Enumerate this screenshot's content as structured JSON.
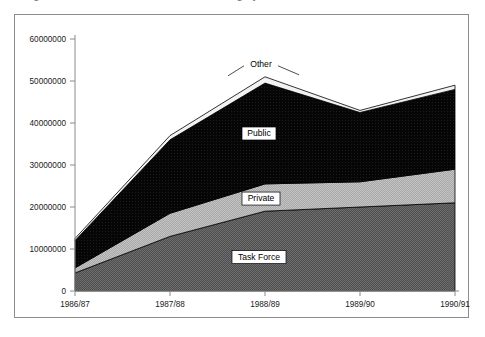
{
  "caption_remnant": "Figure 3.  Residential construction financing by source of funds",
  "chart_data": {
    "type": "area",
    "stacked": true,
    "title": "",
    "xlabel": "",
    "ylabel": "",
    "categories": [
      "1986/87",
      "1987/88",
      "1988/89",
      "1989/90",
      "1990/91"
    ],
    "ylim": [
      0,
      60000000
    ],
    "yticks": [
      0,
      10000000,
      20000000,
      30000000,
      40000000,
      50000000,
      60000000
    ],
    "ytick_labels": [
      "0",
      "10000000",
      "20000000",
      "30000000",
      "40000000",
      "50000000",
      "60000000"
    ],
    "grid": false,
    "legend_position": "inline-annotations",
    "series": [
      {
        "name": "Task Force",
        "fill": "#595959",
        "pattern": "dark-hatch",
        "values": [
          4300000,
          13000000,
          19000000,
          20000000,
          21000000
        ]
      },
      {
        "name": "Private",
        "fill": "#b0b0b0",
        "pattern": "light-hatch",
        "values": [
          1200000,
          5500000,
          6500000,
          6000000,
          8000000
        ]
      },
      {
        "name": "Public",
        "fill": "#000000",
        "pattern": "solid",
        "values": [
          6500000,
          17500000,
          24000000,
          16500000,
          19000000
        ]
      },
      {
        "name": "Other",
        "fill": "#f2f2f2",
        "pattern": "white",
        "values": [
          500000,
          1000000,
          1500000,
          500000,
          1000000
        ]
      }
    ],
    "series_totals": [
      12500000,
      37000000,
      51000000,
      43000000,
      49000000
    ],
    "annotations": [
      {
        "label": "Other",
        "boxed": false
      },
      {
        "label": "Public",
        "boxed": true
      },
      {
        "label": "Private",
        "boxed": true
      },
      {
        "label": "Task Force",
        "boxed": true
      }
    ]
  },
  "colors": {
    "frame_border": "#8d8d8d",
    "axis": "#8a8a8a",
    "text": "#1a1a1a",
    "task_force": "#595959",
    "private": "#b0b0b0",
    "public": "#000000",
    "other": "#f2f2f2"
  }
}
